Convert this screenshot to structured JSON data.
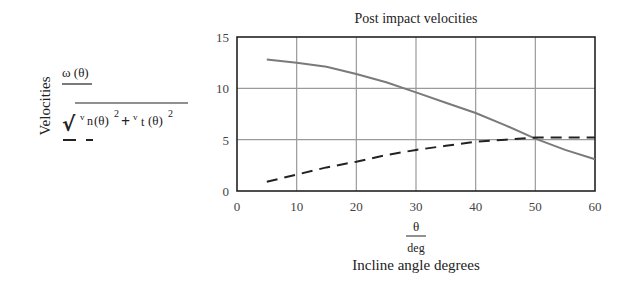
{
  "chart_data": {
    "type": "line",
    "title": "Post impact velocities",
    "xlabel": "Incline angle degrees",
    "xlabel_expr": {
      "numerator": "θ",
      "denominator": "deg"
    },
    "ylabel": "Velocities",
    "xlim": [
      0,
      60
    ],
    "ylim": [
      0,
      15
    ],
    "x_ticks": [
      0,
      10,
      20,
      30,
      40,
      50,
      60
    ],
    "y_ticks": [
      0,
      5,
      10,
      15
    ],
    "grid": true,
    "x": [
      5,
      10,
      15,
      20,
      25,
      30,
      35,
      40,
      45,
      50,
      55,
      60
    ],
    "series": [
      {
        "name": "ω(θ) / √(v_n(θ)² + v_t(θ)²) — ω(θ)",
        "label": "ω(θ)",
        "style": "solid",
        "color": "#7a7a7a",
        "values": [
          12.8,
          12.5,
          12.1,
          11.4,
          10.6,
          9.6,
          8.6,
          7.6,
          6.4,
          5.1,
          4.0,
          3.1
        ]
      },
      {
        "name": "√(v_n(θ)² + v_t(θ)²)",
        "label": "sqrt(vn(θ)^2 + vt(θ)^2)",
        "style": "dashed",
        "color": "#222222",
        "values": [
          0.9,
          1.6,
          2.3,
          2.85,
          3.5,
          4.0,
          4.4,
          4.8,
          5.0,
          5.2,
          5.2,
          5.2
        ]
      }
    ]
  },
  "labels": {
    "title": "Post impact velocities",
    "ylabel": "Velocities",
    "xlabel": "Incline angle degrees",
    "x_num": "θ",
    "x_den": "deg",
    "expr1": "ω (θ)",
    "expr2_vn": "v",
    "expr2_n": "n",
    "expr2_theta1": "(θ)",
    "expr2_sq1": "2",
    "expr2_plus": "+",
    "expr2_vt": "v",
    "expr2_t": "t",
    "expr2_theta2": "(θ)",
    "expr2_sq2": "2",
    "sqrt_sign": "√"
  },
  "colors": {
    "grid": "#9a9a9a",
    "axis": "#222222",
    "solid_series": "#7a7a7a",
    "dashed_series": "#222222"
  }
}
